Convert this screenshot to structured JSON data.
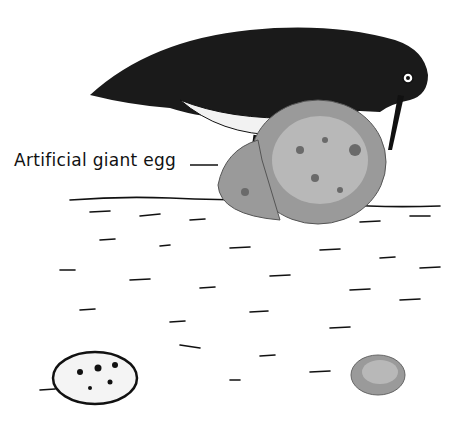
{
  "figure": {
    "label": "Artificial giant egg",
    "colors": {
      "ink": "#111111",
      "egg_gray": "#8a8a8a",
      "egg_light": "#c8c8c8",
      "background": "#ffffff"
    },
    "elements": [
      "bird",
      "artificial-giant-egg",
      "small-egg-left",
      "small-egg-right",
      "ground"
    ]
  }
}
